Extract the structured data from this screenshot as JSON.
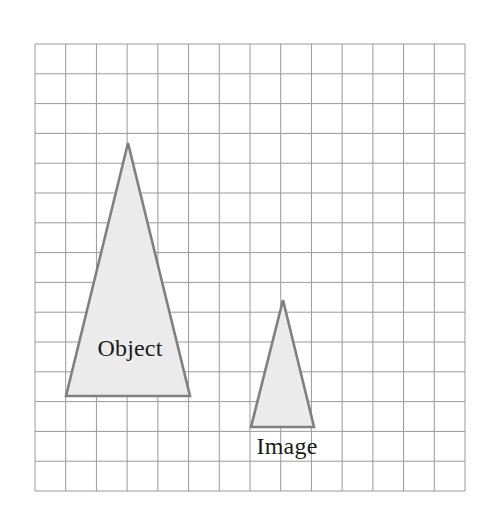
{
  "figure": {
    "background_color": "#ffffff",
    "width": 487,
    "height": 524
  },
  "grid": {
    "name": "square-grid",
    "line_color": "#9a9a9a",
    "line_width": 1,
    "columns": 14,
    "rows": 15,
    "cell_width": 30.7,
    "cell_height": 29.8,
    "left": 35,
    "top": 44,
    "right": 465,
    "bottom": 491
  },
  "shapes": [
    {
      "name": "object-triangle",
      "label": "Object",
      "fill_color": "#ebebeb",
      "stroke_color": "#808080",
      "stroke_width": 2.6,
      "points": "128,143 190,396 66,396",
      "apex": [
        128,
        143
      ],
      "base_left": [
        66,
        396
      ],
      "base_right": [
        190,
        396
      ],
      "base_width_cells": 4,
      "height_cells": 8.5,
      "label_x": 130,
      "label_y": 356
    },
    {
      "name": "image-triangle",
      "label": "Image",
      "fill_color": "#ebebeb",
      "stroke_color": "#808080",
      "stroke_width": 2.6,
      "points": "283,300 314,427 251,427",
      "apex": [
        283,
        300
      ],
      "base_left": [
        251,
        427
      ],
      "base_right": [
        314,
        427
      ],
      "base_width_cells": 2,
      "height_cells": 4.25,
      "label_x": 287,
      "label_y": 454
    }
  ],
  "chart_data": {
    "type": "diagram",
    "grid": {
      "columns": 14,
      "rows": 15
    },
    "annotations": [
      "Object",
      "Image"
    ],
    "series": [
      {
        "name": "Object",
        "base_cells": 4,
        "height_cells": 8.5
      },
      {
        "name": "Image",
        "base_cells": 2,
        "height_cells": 4.25
      }
    ]
  }
}
